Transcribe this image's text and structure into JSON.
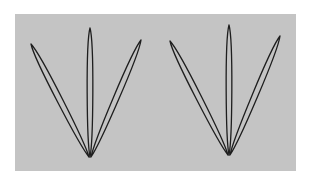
{
  "diagram": {
    "background": "#ffffff",
    "panel": {
      "x": 15,
      "y": 14,
      "width": 281,
      "height": 157,
      "fill": "#c4c4c4"
    },
    "stroke": "#1e1e1e",
    "stroke_width": 1.3,
    "groups": [
      {
        "name": "left-lobe-group",
        "petals": [
          {
            "name": "left-petal",
            "tip": [
              31,
              44
            ],
            "base": [
              89,
              157
            ],
            "half_width": 3.6
          },
          {
            "name": "center-petal",
            "tip": [
              90,
              28
            ],
            "base": [
              90,
              157
            ],
            "half_width": 3.6
          },
          {
            "name": "right-petal",
            "tip": [
              141,
              40
            ],
            "base": [
              91,
              157
            ],
            "half_width": 3.6
          }
        ]
      },
      {
        "name": "right-lobe-group",
        "petals": [
          {
            "name": "left-petal",
            "tip": [
              170,
              41
            ],
            "base": [
              228,
              155
            ],
            "half_width": 3.6
          },
          {
            "name": "center-petal",
            "tip": [
              229,
              25
            ],
            "base": [
              229,
              155
            ],
            "half_width": 3.6
          },
          {
            "name": "right-petal",
            "tip": [
              280,
              36
            ],
            "base": [
              230,
              155
            ],
            "half_width": 3.6
          }
        ]
      }
    ]
  }
}
